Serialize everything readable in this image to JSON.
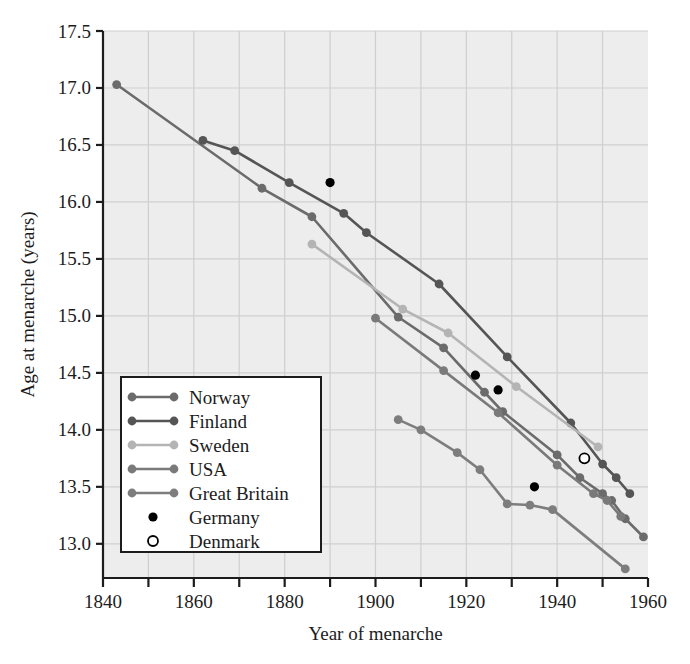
{
  "chart_data": {
    "type": "line",
    "title": "",
    "xlabel": "Year of menarche",
    "ylabel": "Age at menarche (years)",
    "xlim": [
      1840,
      1960
    ],
    "ylim": [
      12.7,
      17.5
    ],
    "xticks": [
      1840,
      1860,
      1880,
      1900,
      1920,
      1940,
      1960
    ],
    "xminorticks": [
      1850,
      1870,
      1890,
      1910,
      1930,
      1950
    ],
    "yticks": [
      13.0,
      13.5,
      14.0,
      14.5,
      15.0,
      15.5,
      16.0,
      16.5,
      17.0,
      17.5
    ],
    "grid": true,
    "legend_position": "lower-left-inside",
    "series": [
      {
        "name": "Norway",
        "marker": "filled-circle",
        "color": "#6b6b6b",
        "line": true,
        "points": [
          [
            1843,
            17.03
          ],
          [
            1875,
            16.12
          ],
          [
            1886,
            15.87
          ],
          [
            1905,
            14.99
          ],
          [
            1915,
            14.72
          ],
          [
            1924,
            14.33
          ],
          [
            1928,
            14.16
          ],
          [
            1940,
            13.78
          ],
          [
            1945,
            13.58
          ],
          [
            1950,
            13.44
          ],
          [
            1952,
            13.38
          ],
          [
            1955,
            13.22
          ],
          [
            1959,
            13.06
          ]
        ]
      },
      {
        "name": "Finland",
        "marker": "filled-circle",
        "color": "#555555",
        "line": true,
        "points": [
          [
            1862,
            16.54
          ],
          [
            1869,
            16.45
          ],
          [
            1881,
            16.17
          ],
          [
            1893,
            15.9
          ],
          [
            1898,
            15.73
          ],
          [
            1914,
            15.28
          ],
          [
            1929,
            14.64
          ],
          [
            1943,
            14.06
          ],
          [
            1950,
            13.7
          ],
          [
            1953,
            13.58
          ],
          [
            1956,
            13.44
          ]
        ]
      },
      {
        "name": "Sweden",
        "marker": "filled-circle",
        "color": "#b4b4b4",
        "line": true,
        "points": [
          [
            1886,
            15.63
          ],
          [
            1906,
            15.06
          ],
          [
            1916,
            14.85
          ],
          [
            1931,
            14.38
          ],
          [
            1949,
            13.85
          ]
        ]
      },
      {
        "name": "USA",
        "marker": "filled-circle",
        "color": "#7a7a7a",
        "line": true,
        "points": [
          [
            1900,
            14.98
          ],
          [
            1915,
            14.52
          ],
          [
            1927,
            14.15
          ],
          [
            1940,
            13.69
          ],
          [
            1948,
            13.44
          ],
          [
            1951,
            13.38
          ],
          [
            1954,
            13.24
          ]
        ]
      },
      {
        "name": "Great Britain",
        "marker": "filled-circle",
        "color": "#7d7d7d",
        "line": true,
        "points": [
          [
            1905,
            14.09
          ],
          [
            1910,
            14.0
          ],
          [
            1918,
            13.8
          ],
          [
            1923,
            13.65
          ],
          [
            1929,
            13.35
          ],
          [
            1934,
            13.34
          ],
          [
            1939,
            13.3
          ],
          [
            1955,
            12.78
          ]
        ]
      },
      {
        "name": "Germany",
        "marker": "filled-dot",
        "color": "#000000",
        "line": false,
        "points": [
          [
            1890,
            16.17
          ],
          [
            1922,
            14.48
          ],
          [
            1927,
            14.35
          ],
          [
            1935,
            13.5
          ]
        ]
      },
      {
        "name": "Denmark",
        "marker": "open-circle",
        "color": "#000000",
        "line": false,
        "points": [
          [
            1946,
            13.75
          ]
        ]
      }
    ]
  },
  "legend": {
    "entries": [
      {
        "label": "Norway"
      },
      {
        "label": "Finland"
      },
      {
        "label": "Sweden"
      },
      {
        "label": "USA"
      },
      {
        "label": "Great Britain"
      },
      {
        "label": "Germany"
      },
      {
        "label": "Denmark"
      }
    ]
  },
  "colors": {
    "plot_background": "#ededed",
    "grid": "#cfcfcf",
    "axis": "#1c1c1c",
    "page_background": "#ffffff"
  }
}
